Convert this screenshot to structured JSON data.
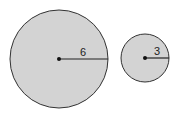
{
  "diagram": {
    "fill_color": "#d3d3d3",
    "stroke_color": "#333333",
    "circles": [
      {
        "name": "large-circle",
        "cx": 59,
        "cy": 59,
        "r": 49,
        "radius_label": "6"
      },
      {
        "name": "small-circle",
        "cx": 145,
        "cy": 58,
        "r": 24,
        "radius_label": "3"
      }
    ]
  }
}
